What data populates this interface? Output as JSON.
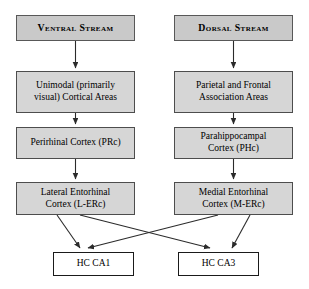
{
  "diagram": {
    "title_left": "Ventral Stream",
    "title_right": "Dorsal Stream",
    "colors": {
      "header_fill": "#c9c9c9",
      "node_fill": "#d6d6d6",
      "terminal_fill": "#ffffff",
      "border": "#4d4d4d",
      "arrow": "#2b2b2b"
    },
    "nodes": [
      {
        "id": "ventral-stream",
        "label": "Ventral Stream",
        "column": "left",
        "level": 0,
        "style": "header"
      },
      {
        "id": "dorsal-stream",
        "label": "Dorsal Stream",
        "column": "right",
        "level": 0,
        "style": "header"
      },
      {
        "id": "unimodal-visual-cortical-areas",
        "label": "Unimodal (primarily\nvisual) Cortical Areas",
        "column": "left",
        "level": 1,
        "style": "filled"
      },
      {
        "id": "parietal-frontal-association-areas",
        "label": "Parietal and Frontal\nAssociation Areas",
        "column": "right",
        "level": 1,
        "style": "filled"
      },
      {
        "id": "perirhinal-cortex",
        "label": "Perirhinal Cortex (PRc)",
        "column": "left",
        "level": 2,
        "style": "filled"
      },
      {
        "id": "parahippocampal-cortex",
        "label": "Parahippocampal\nCortex (PHc)",
        "column": "right",
        "level": 2,
        "style": "filled"
      },
      {
        "id": "lateral-entorhinal-cortex",
        "label": "Lateral Entorhinal\nCortex (L-ERc)",
        "column": "left",
        "level": 3,
        "style": "filled"
      },
      {
        "id": "medial-entorhinal-cortex",
        "label": "Medial Entorhinal\nCortex (M-ERc)",
        "column": "right",
        "level": 3,
        "style": "filled"
      },
      {
        "id": "hc-ca1",
        "label": "HC CA1",
        "column": "left",
        "level": 4,
        "style": "plain"
      },
      {
        "id": "hc-ca3",
        "label": "HC CA3",
        "column": "right",
        "level": 4,
        "style": "plain"
      }
    ],
    "edges": [
      {
        "from": "ventral-stream",
        "to": "unimodal-visual-cortical-areas"
      },
      {
        "from": "dorsal-stream",
        "to": "parietal-frontal-association-areas"
      },
      {
        "from": "unimodal-visual-cortical-areas",
        "to": "perirhinal-cortex"
      },
      {
        "from": "parietal-frontal-association-areas",
        "to": "parahippocampal-cortex"
      },
      {
        "from": "perirhinal-cortex",
        "to": "lateral-entorhinal-cortex"
      },
      {
        "from": "parahippocampal-cortex",
        "to": "medial-entorhinal-cortex"
      },
      {
        "from": "lateral-entorhinal-cortex",
        "to": "hc-ca1"
      },
      {
        "from": "lateral-entorhinal-cortex",
        "to": "hc-ca3"
      },
      {
        "from": "medial-entorhinal-cortex",
        "to": "hc-ca1"
      },
      {
        "from": "medial-entorhinal-cortex",
        "to": "hc-ca3"
      }
    ]
  }
}
